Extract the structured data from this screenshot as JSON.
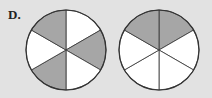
{
  "label": "D.",
  "colors": {
    "shaded": "#a6a6a6",
    "unshaded": "#ffffff",
    "stroke": "#333333",
    "background": "#e2e2e2"
  },
  "circles": [
    {
      "name": "left-circle",
      "cx": 66,
      "cy": 50,
      "r": 40,
      "sectors": 6,
      "shaded": [
        1,
        3,
        5
      ],
      "shaded_count": 3
    },
    {
      "name": "right-circle",
      "cx": 159,
      "cy": 50,
      "r": 40,
      "sectors": 6,
      "shaded": [
        0,
        5
      ],
      "shaded_count": 2
    }
  ]
}
